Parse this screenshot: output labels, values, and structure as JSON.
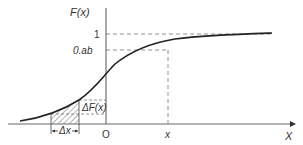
{
  "diagram": {
    "type": "cumulative-distribution-function",
    "y_axis_label": "F(x)",
    "x_axis_label": "X",
    "y_ticks": [
      {
        "label": "1"
      },
      {
        "label": "0.ab"
      }
    ],
    "x_ticks": [
      {
        "label": "O"
      },
      {
        "label": "x"
      }
    ],
    "annotations": {
      "delta_f": "ΔF(x)",
      "delta_x": "Δx"
    },
    "colors": {
      "curve": "#222222",
      "axis": "#555555",
      "dashed": "#666666",
      "hatch": "#444444"
    }
  }
}
